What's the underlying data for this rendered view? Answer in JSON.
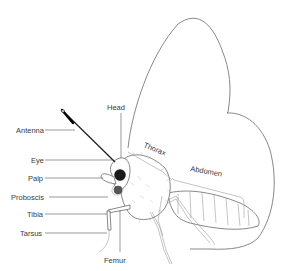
{
  "diagram": {
    "labels": {
      "head": "Head",
      "antenna": "Antenna",
      "eye": "Eye",
      "palp": "Palp",
      "proboscis": "Proboscis",
      "tibia": "Tibia",
      "tarsus": "Tarsus",
      "femur": "Femur",
      "thorax": "Thorax",
      "abdomen": "Abdomen"
    }
  }
}
